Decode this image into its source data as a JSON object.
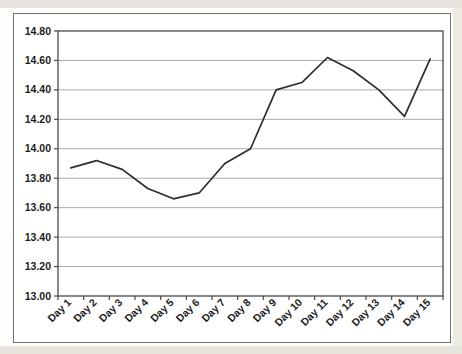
{
  "page": {
    "background": "#fdfdfb",
    "top_strip_color": "#e7e4de",
    "bottom_strip_color": "#e7e4de",
    "right_strip_color": "#edeae4",
    "frame_border_color": "#6f6f6f",
    "frame_background": "#ffffff"
  },
  "chart_data": {
    "type": "line",
    "title": "",
    "xlabel": "",
    "ylabel": "",
    "legend": "none",
    "grid": "horizontal",
    "categories": [
      "Day 1",
      "Day 2",
      "Day 3",
      "Day 4",
      "Day 5",
      "Day 6",
      "Day 7",
      "Day 8",
      "Day 9",
      "Day 10",
      "Day 11",
      "Day 12",
      "Day 13",
      "Day 14",
      "Day 15"
    ],
    "values": [
      13.87,
      13.92,
      13.86,
      13.73,
      13.66,
      13.7,
      13.9,
      14.0,
      14.4,
      14.45,
      14.62,
      14.53,
      14.4,
      14.22,
      14.61
    ],
    "ylim": [
      13.0,
      14.8
    ],
    "ytick_step": 0.2,
    "ytick_labels": [
      "14.80",
      "14.60",
      "14.40",
      "14.20",
      "14.00",
      "13.80",
      "13.60",
      "13.40",
      "13.20",
      "13.00"
    ],
    "x_tick_rotation_deg": 45,
    "line_color": "#2e2e2e",
    "line_width": 1.7,
    "gridline_color": "#ababab",
    "axis_color": "#4a4a4a",
    "tick_label_color": "#1c1c1c"
  }
}
